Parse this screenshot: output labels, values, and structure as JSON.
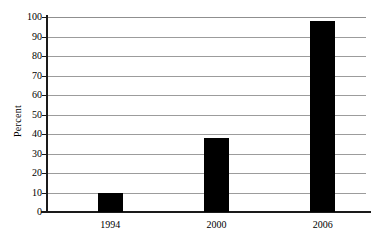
{
  "chart_data": {
    "type": "bar",
    "title": "",
    "subtitle": "",
    "xlabel": "",
    "ylabel": "Percent",
    "categories": [
      "1994",
      "2000",
      "2006"
    ],
    "values": [
      9.5,
      38,
      98
    ],
    "series": [
      {
        "name": "Percent",
        "values": [
          9.5,
          38,
          98
        ]
      }
    ],
    "ylim": [
      0,
      100
    ],
    "ytick_labels": [
      "0",
      "10",
      "20",
      "30",
      "40",
      "50",
      "60",
      "70",
      "80",
      "90",
      "100"
    ],
    "ytick_values": [
      0,
      10,
      20,
      30,
      40,
      50,
      60,
      70,
      80,
      90,
      100
    ],
    "grid": true,
    "grid_orientation": "horizontal",
    "legend": false,
    "legend_position": "none",
    "annotations": [],
    "bar_color": "#000000",
    "grid_color": "#9c9c9c",
    "axis_color": "#1a1a1a",
    "background_color": "#ffffff"
  }
}
